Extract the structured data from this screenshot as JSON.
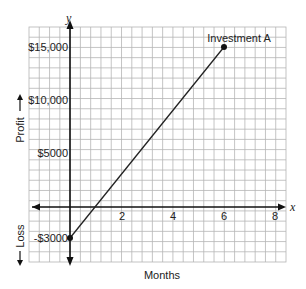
{
  "chart_data": {
    "type": "line",
    "title": "",
    "xlabel": "Months",
    "ylabel_positive": "Profit",
    "ylabel_negative": "Loss",
    "x_axis_symbol": "x",
    "y_axis_symbol": "y",
    "x_ticks": [
      2,
      4,
      6,
      8
    ],
    "x_tick_labels": [
      "2",
      "4",
      "6",
      "8"
    ],
    "y_ticks": [
      15000,
      10000,
      5000,
      -3000
    ],
    "y_tick_labels": [
      "$15,000",
      "$10,000",
      "$5000",
      "-$3000"
    ],
    "xlim": [
      -1.6,
      8.5
    ],
    "ylim": [
      -5000,
      17000
    ],
    "grid": true,
    "series": [
      {
        "name": "Investment A",
        "x": [
          0,
          6
        ],
        "y": [
          -3000,
          15000
        ]
      }
    ],
    "annotations": [
      {
        "text": "Investment A",
        "x": 6,
        "y": 15000
      }
    ]
  }
}
